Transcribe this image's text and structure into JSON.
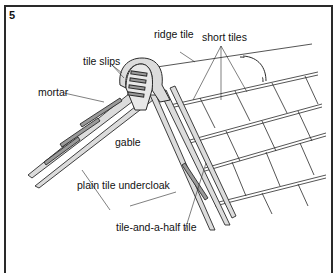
{
  "figure": {
    "number": "5"
  },
  "labels": {
    "ridge_tile": "ridge tile",
    "short_tiles": "short tiles",
    "tile_slips": "tile slips",
    "mortar": "mortar",
    "gable": "gable",
    "plain_tile_undercloak": "plain tile undercloak",
    "tile_and_a_half_tile": "tile-and-a-half tile"
  },
  "colors": {
    "line": "#2a2a2a",
    "fill_light": "#dcdcdc",
    "fill_mid": "#9a9a9a",
    "background": "#ffffff"
  }
}
